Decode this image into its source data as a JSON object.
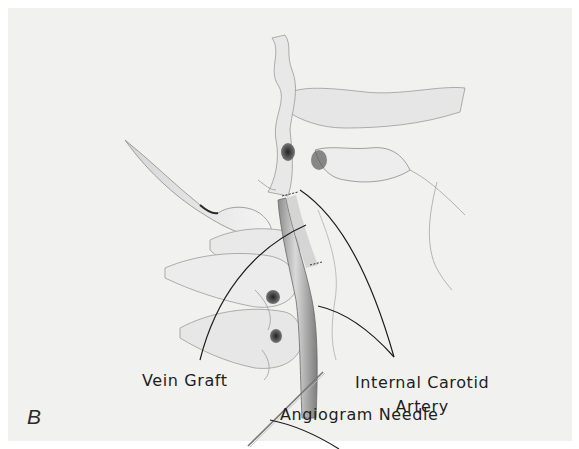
{
  "figure": {
    "panel_letter": "B",
    "background_color": "#f1f1f0",
    "ink_color": "#1e1e1e"
  },
  "labels": {
    "vein_graft": "Vein Graft",
    "internal_carotid_line1": "Internal Carotid",
    "internal_carotid_line2": "Artery",
    "angiogram_needle": "Angiogram Needle"
  },
  "structures": [
    "skull-base",
    "mandible",
    "cervical-vertebrae",
    "internal-carotid-artery",
    "vein-graft",
    "angiogram-needle"
  ]
}
